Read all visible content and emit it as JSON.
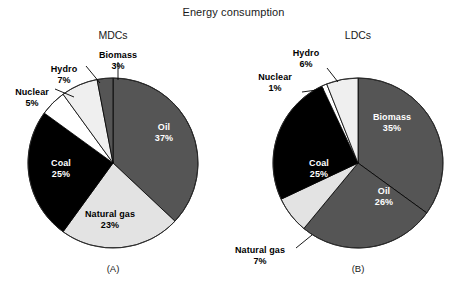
{
  "figure": {
    "title": "Energy consumption"
  },
  "chart_data": [
    {
      "type": "pie",
      "title": "MDCs",
      "caption": "(A)",
      "unit": "%",
      "categories": [
        "Oil",
        "Natural gas",
        "Coal",
        "Nuclear",
        "Hydro",
        "Biomass"
      ],
      "values": [
        37,
        23,
        25,
        5,
        7,
        3
      ],
      "labels": [
        "37%",
        "23%",
        "25%",
        "5%",
        "7%",
        "3%"
      ],
      "slice_colors": [
        "#555555",
        "#e3e3e3",
        "#000000",
        "#ffffff",
        "#efefef",
        "#555555"
      ],
      "legend": "none",
      "grid": false,
      "start_angle_deg": 0,
      "direction": "clockwise"
    },
    {
      "type": "pie",
      "title": "LDCs",
      "caption": "(B)",
      "unit": "%",
      "categories": [
        "Biomass",
        "Oil",
        "Natural gas",
        "Coal",
        "Nuclear",
        "Hydro"
      ],
      "values": [
        35,
        26,
        7,
        25,
        1,
        6
      ],
      "labels": [
        "35%",
        "26%",
        "7%",
        "25%",
        "1%",
        "6%"
      ],
      "slice_colors": [
        "#555555",
        "#555555",
        "#e3e3e3",
        "#000000",
        "#ffffff",
        "#efefef"
      ],
      "legend": "none",
      "grid": false,
      "start_angle_deg": 0,
      "direction": "clockwise"
    }
  ],
  "mdcs_labels": {
    "oil_name": "Oil",
    "oil_pct": "37%",
    "natural_gas_name": "Natural gas",
    "natural_gas_pct": "23%",
    "coal_name": "Coal",
    "coal_pct": "25%",
    "nuclear_name": "Nuclear",
    "nuclear_pct": "5%",
    "hydro_name": "Hydro",
    "hydro_pct": "7%",
    "biomass_name": "Biomass",
    "biomass_pct": "3%"
  },
  "ldcs_labels": {
    "biomass_name": "Biomass",
    "biomass_pct": "35%",
    "oil_name": "Oil",
    "oil_pct": "26%",
    "natural_gas_name": "Natural gas",
    "natural_gas_pct": "7%",
    "coal_name": "Coal",
    "coal_pct": "25%",
    "nuclear_name": "Nuclear",
    "nuclear_pct": "1%",
    "hydro_name": "Hydro",
    "hydro_pct": "6%"
  }
}
